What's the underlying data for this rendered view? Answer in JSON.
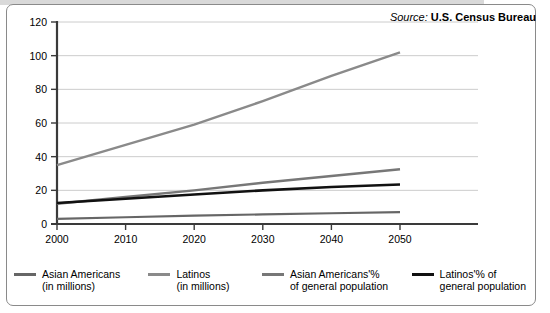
{
  "source": {
    "label": "Source:",
    "name": "U.S. Census Bureau"
  },
  "chart_data": {
    "type": "line",
    "title": "",
    "subtitle": "",
    "xlabel": "",
    "ylabel": "",
    "categories": [
      "2000",
      "2010",
      "2020",
      "2030",
      "2040",
      "2050"
    ],
    "x": [
      2000,
      2010,
      2020,
      2030,
      2040,
      2050
    ],
    "xlim": [
      2000,
      2050
    ],
    "ylim": [
      0,
      120
    ],
    "yticks": [
      0,
      20,
      40,
      60,
      80,
      100,
      120
    ],
    "ytick_labels": [
      "0",
      "20",
      "40",
      "60",
      "80",
      "100",
      "120"
    ],
    "xtick_labels": [
      "2000",
      "2010",
      "2020",
      "2030",
      "2040",
      "2050"
    ],
    "grid": true,
    "grid_axis": "y",
    "legend_position": "bottom",
    "series": [
      {
        "name": "Asian Americans\n(in millions)",
        "label_line1": "Asian Americans",
        "label_line2": "(in millions)",
        "color": "#666666",
        "width": 2.2,
        "values": [
          3,
          4,
          5,
          5.7,
          6.4,
          7
        ]
      },
      {
        "name": "Latinos\n(in millions)",
        "label_line1": "Latinos",
        "label_line2": "(in millions)",
        "color": "#8a8a8a",
        "width": 2.4,
        "values": [
          35,
          47,
          59,
          73,
          88,
          102
        ]
      },
      {
        "name": "Asian Americans'% of general population",
        "label_line1": "Asian Americans'%",
        "label_line2": "of general population",
        "color": "#777777",
        "width": 2.4,
        "values": [
          12,
          16,
          20,
          24.5,
          28.5,
          32.5
        ]
      },
      {
        "name": "Latinos'% of general population",
        "label_line1": "Latinos'% of",
        "label_line2": "general population",
        "color": "#111111",
        "width": 2.6,
        "values": [
          12.5,
          15,
          17.5,
          20,
          22,
          23.5
        ]
      }
    ]
  },
  "colors": {
    "frame_border": "#8a8a8a",
    "axis": "#3a3a3a",
    "gridline": "#cccccc",
    "background": "#ffffff",
    "text": "#000000"
  }
}
